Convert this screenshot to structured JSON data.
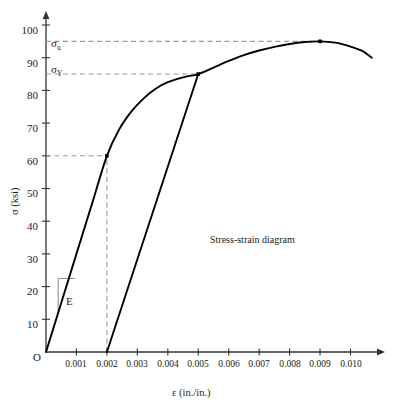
{
  "chart_data": {
    "type": "line",
    "title": "",
    "annotation": "Stress-strain diagram",
    "xlabel": "ε (in./in.)",
    "ylabel": "σ (ksi)",
    "origin_label": "O",
    "xlim": [
      0,
      0.0112
    ],
    "ylim": [
      0,
      106
    ],
    "grid": false,
    "legend": "none",
    "xticks": [
      0.001,
      0.002,
      0.003,
      0.004,
      0.005,
      0.006,
      0.007,
      0.008,
      0.009,
      0.01
    ],
    "xtick_labels": [
      "0.001",
      "0.002",
      "0.003",
      "0.004",
      "0.005",
      "0.006",
      "0.007",
      "0.008",
      "0.009",
      "0.010"
    ],
    "yticks": [
      10,
      20,
      30,
      40,
      50,
      60,
      70,
      80,
      90,
      100
    ],
    "ytick_labels": [
      "10",
      "20",
      "30",
      "40",
      "50",
      "60",
      "70",
      "80",
      "90",
      "100"
    ],
    "series": [
      {
        "name": "stress-strain curve",
        "points": [
          [
            0.0,
            0
          ],
          [
            0.0005,
            15
          ],
          [
            0.001,
            30
          ],
          [
            0.0015,
            45
          ],
          [
            0.002,
            60
          ],
          [
            0.0024,
            68
          ],
          [
            0.0028,
            73.5
          ],
          [
            0.0032,
            77.5
          ],
          [
            0.0036,
            80.5
          ],
          [
            0.004,
            82.5
          ],
          [
            0.0045,
            84.0
          ],
          [
            0.005,
            85.0
          ],
          [
            0.0055,
            87.0
          ],
          [
            0.006,
            89.0
          ],
          [
            0.0065,
            90.8
          ],
          [
            0.007,
            92.2
          ],
          [
            0.0075,
            93.3
          ],
          [
            0.008,
            94.2
          ],
          [
            0.0085,
            94.8
          ],
          [
            0.009,
            95.0
          ],
          [
            0.0095,
            94.6
          ],
          [
            0.01,
            93.4
          ],
          [
            0.0104,
            92.0
          ],
          [
            0.0107,
            90.0
          ]
        ]
      },
      {
        "name": "0.2% offset unloading line",
        "points": [
          [
            0.002,
            0
          ],
          [
            0.005,
            85
          ]
        ]
      }
    ],
    "markers": [
      {
        "label": "proportional limit",
        "x": 0.002,
        "y": 60
      },
      {
        "label": "yield point",
        "x": 0.005,
        "y": 85
      },
      {
        "label": "ultimate strength",
        "x": 0.009,
        "y": 95
      }
    ],
    "guides": [
      {
        "label": "sigma-u level",
        "type": "horizontal",
        "y": 95,
        "from_x": 0,
        "to_x": 0.009,
        "style": "dashed"
      },
      {
        "label": "sigma-Y level",
        "type": "horizontal",
        "y": 85,
        "from_x": 0,
        "to_x": 0.005,
        "style": "dashed"
      },
      {
        "label": "proportional limit level",
        "type": "horizontal",
        "y": 60,
        "from_x": 0,
        "to_x": 0.002,
        "style": "dashed"
      },
      {
        "label": "proportional limit strain",
        "type": "vertical",
        "x": 0.002,
        "from_y": 0,
        "to_y": 60,
        "style": "dashed"
      }
    ],
    "annotations": [
      {
        "name": "sigma-u",
        "symbol": "σ",
        "subscript": "u",
        "value": 95
      },
      {
        "name": "sigma-Y",
        "symbol": "σ",
        "subscript": "Y",
        "value": 85
      },
      {
        "name": "modulus",
        "symbol": "E"
      }
    ],
    "modulus_triangle": {
      "label": "E",
      "x_left": 0.0004,
      "y_bottom": 12.5,
      "y_top": 22.5,
      "x_right": 0.00095
    },
    "colors": {
      "curve": "#000000",
      "axis": "#333333",
      "dashed_guide": "#9a9a9a",
      "modulus_box": "#8a8a8a",
      "text": "#1a1a1a",
      "background": "#ffffff"
    }
  },
  "figure": {
    "caption_text": "Stress-strain diagram",
    "modulus_label": "E",
    "sigma_u_symbol": "σ",
    "sigma_u_sub": "u",
    "sigma_y_symbol": "σ",
    "sigma_y_sub": "Y",
    "origin": "O",
    "x_axis_title": "ε (in./in.)",
    "y_axis_title": "σ (ksi)"
  }
}
